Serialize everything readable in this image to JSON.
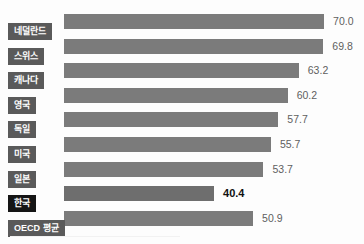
{
  "chart_data": {
    "type": "bar",
    "orientation": "horizontal",
    "title": "",
    "subtitle": "",
    "xlabel": "",
    "ylabel": "",
    "grid": false,
    "legend": null,
    "axis_visible": false,
    "xlim": [
      0,
      70
    ],
    "value_format": "one-decimal",
    "categories": [
      "네덜란드",
      "스위스",
      "캐나다",
      "영국",
      "독일",
      "미국",
      "일본",
      "한국",
      "OECD 평균"
    ],
    "values": [
      70.0,
      69.8,
      63.2,
      60.2,
      57.7,
      55.7,
      53.7,
      40.4,
      50.9
    ],
    "value_labels": [
      "70.0",
      "69.8",
      "63.2",
      "60.2",
      "57.7",
      "55.7",
      "53.7",
      "40.4",
      "50.9"
    ],
    "highlight_index": 7,
    "highlight_category": "한국",
    "colors": {
      "bar": "#7b7b7b",
      "bar_highlight": "#6e6e6e",
      "label_tab": "#5a5a5a",
      "label_tab_highlight": "#151515",
      "label_text": "#ffffff",
      "value_text": "#5f5f5f",
      "value_text_highlight": "#111111",
      "background": "#fdfdfd"
    },
    "rows": [
      {
        "category": "네덜란드",
        "value": 70.0,
        "value_label": "70.0",
        "highlight": false
      },
      {
        "category": "스위스",
        "value": 69.8,
        "value_label": "69.8",
        "highlight": false
      },
      {
        "category": "캐나다",
        "value": 63.2,
        "value_label": "63.2",
        "highlight": false
      },
      {
        "category": "영국",
        "value": 60.2,
        "value_label": "60.2",
        "highlight": false
      },
      {
        "category": "독일",
        "value": 57.7,
        "value_label": "57.7",
        "highlight": false
      },
      {
        "category": "미국",
        "value": 55.7,
        "value_label": "55.7",
        "highlight": false
      },
      {
        "category": "일본",
        "value": 53.7,
        "value_label": "53.7",
        "highlight": false
      },
      {
        "category": "한국",
        "value": 40.4,
        "value_label": "40.4",
        "highlight": true
      },
      {
        "category": "OECD 평균",
        "value": 50.9,
        "value_label": "50.9",
        "highlight": false
      }
    ]
  },
  "layout": {
    "bar_origin_x": 64,
    "px_per_unit": 3.715,
    "row_top_start": 14,
    "row_step": 24.6,
    "bar_height": 15,
    "value_gap": 9
  }
}
